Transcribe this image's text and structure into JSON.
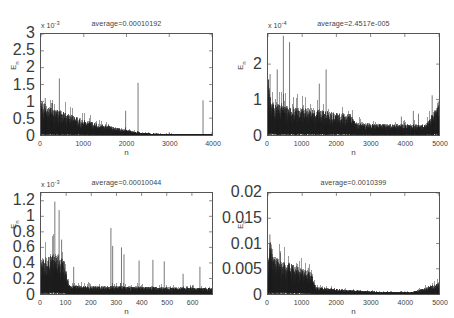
{
  "figure": {
    "background": "#ffffff",
    "axis_color": "#555555",
    "line_color": "#1a1a1a",
    "text_color": "#3f3f3f",
    "rows": 2,
    "cols": 2
  },
  "chart_data": [
    {
      "type": "line",
      "id": "subplot-top-left",
      "title": "average=0.00010192",
      "average": 0.00010192,
      "xlabel": "n",
      "ylabel": "E_n",
      "y_exponent_label": "x 10",
      "y_exponent": "-3",
      "y_scale": 0.001,
      "xlim": [
        0,
        4000
      ],
      "ylim": [
        0,
        3
      ],
      "xticks": [
        0,
        1000,
        2000,
        3000,
        4000
      ],
      "yticks": [
        0,
        0.5,
        1,
        1.5,
        2,
        2.5,
        3
      ],
      "xtick_labels": [
        "0",
        "1000",
        "2000",
        "3000",
        "4000"
      ],
      "ytick_labels": [
        "0",
        "0.5",
        "1",
        "1.5",
        "2",
        "2.5",
        "3"
      ],
      "grid": false,
      "legend": null,
      "noise_envelope": [
        {
          "x": 0,
          "y": 1.15
        },
        {
          "x": 60,
          "y": 1.0
        },
        {
          "x": 150,
          "y": 0.85
        },
        {
          "x": 300,
          "y": 0.78
        },
        {
          "x": 500,
          "y": 0.72
        },
        {
          "x": 800,
          "y": 0.55
        },
        {
          "x": 1100,
          "y": 0.42
        },
        {
          "x": 1500,
          "y": 0.3
        },
        {
          "x": 1900,
          "y": 0.2
        },
        {
          "x": 2200,
          "y": 0.1
        },
        {
          "x": 2600,
          "y": 0.05
        },
        {
          "x": 3200,
          "y": 0.03
        },
        {
          "x": 4000,
          "y": 0.03
        }
      ],
      "spikes": [
        {
          "x": 430,
          "y": 1.68
        },
        {
          "x": 1980,
          "y": 0.72
        },
        {
          "x": 2270,
          "y": 1.55
        },
        {
          "x": 3790,
          "y": 1.03
        },
        {
          "x": 100,
          "y": 1.1
        },
        {
          "x": 250,
          "y": 0.95
        }
      ]
    },
    {
      "type": "line",
      "id": "subplot-top-right",
      "title": "average=2.4517e-005",
      "average": 2.4517e-05,
      "xlabel": "n",
      "ylabel": "E_n",
      "y_exponent_label": "x 10",
      "y_exponent": "-4",
      "y_scale": 0.0001,
      "xlim": [
        0,
        5000
      ],
      "ylim": [
        0,
        2.85
      ],
      "xticks": [
        0,
        1000,
        2000,
        3000,
        4000,
        5000
      ],
      "yticks": [
        0,
        1,
        2
      ],
      "xtick_labels": [
        "0",
        "1000",
        "2000",
        "3000",
        "4000",
        "5000"
      ],
      "ytick_labels": [
        "0",
        "1",
        "2"
      ],
      "grid": false,
      "legend": null,
      "noise_envelope": [
        {
          "x": 0,
          "y": 1.7
        },
        {
          "x": 100,
          "y": 0.95
        },
        {
          "x": 400,
          "y": 0.85
        },
        {
          "x": 900,
          "y": 0.8
        },
        {
          "x": 1400,
          "y": 0.75
        },
        {
          "x": 1900,
          "y": 0.65
        },
        {
          "x": 2400,
          "y": 0.6
        },
        {
          "x": 2600,
          "y": 0.35
        },
        {
          "x": 3200,
          "y": 0.32
        },
        {
          "x": 4000,
          "y": 0.3
        },
        {
          "x": 4600,
          "y": 0.3
        },
        {
          "x": 5000,
          "y": 0.9
        }
      ],
      "spikes": [
        {
          "x": 60,
          "y": 1.72
        },
        {
          "x": 270,
          "y": 1.85
        },
        {
          "x": 450,
          "y": 2.8
        },
        {
          "x": 630,
          "y": 2.62
        },
        {
          "x": 1500,
          "y": 1.45
        },
        {
          "x": 1700,
          "y": 1.85
        },
        {
          "x": 3900,
          "y": 0.52
        },
        {
          "x": 4250,
          "y": 0.68
        },
        {
          "x": 4400,
          "y": 0.6
        },
        {
          "x": 4800,
          "y": 1.12
        },
        {
          "x": 4980,
          "y": 0.95
        }
      ]
    },
    {
      "type": "line",
      "id": "subplot-bottom-left",
      "title": "average=0.00010044",
      "average": 0.00010044,
      "xlabel": "n",
      "ylabel": "E_n",
      "y_exponent_label": "x 10",
      "y_exponent": "-3",
      "y_scale": 0.001,
      "xlim": [
        0,
        680
      ],
      "ylim": [
        0,
        1.3
      ],
      "xticks": [
        0,
        100,
        200,
        300,
        400,
        500,
        600
      ],
      "yticks": [
        0,
        0.2,
        0.4,
        0.6,
        0.8,
        1,
        1.2
      ],
      "xtick_labels": [
        "0",
        "100",
        "200",
        "300",
        "400",
        "500",
        "600"
      ],
      "ytick_labels": [
        "0",
        "0.2",
        "0.4",
        "0.6",
        "0.8",
        "1",
        "1.2"
      ],
      "grid": false,
      "legend": null,
      "noise_envelope": [
        {
          "x": 0,
          "y": 0.45
        },
        {
          "x": 30,
          "y": 0.5
        },
        {
          "x": 60,
          "y": 0.55
        },
        {
          "x": 95,
          "y": 0.42
        },
        {
          "x": 110,
          "y": 0.12
        },
        {
          "x": 200,
          "y": 0.1
        },
        {
          "x": 350,
          "y": 0.1
        },
        {
          "x": 500,
          "y": 0.09
        },
        {
          "x": 680,
          "y": 0.08
        }
      ],
      "spikes": [
        {
          "x": 55,
          "y": 1.19
        },
        {
          "x": 72,
          "y": 1.08
        },
        {
          "x": 82,
          "y": 0.7
        },
        {
          "x": 130,
          "y": 0.35
        },
        {
          "x": 278,
          "y": 0.85
        },
        {
          "x": 285,
          "y": 0.62
        },
        {
          "x": 320,
          "y": 0.6
        },
        {
          "x": 330,
          "y": 0.51
        },
        {
          "x": 390,
          "y": 0.43
        },
        {
          "x": 445,
          "y": 0.44
        },
        {
          "x": 490,
          "y": 0.42
        },
        {
          "x": 565,
          "y": 0.26
        },
        {
          "x": 632,
          "y": 0.35
        }
      ]
    },
    {
      "type": "line",
      "id": "subplot-bottom-right",
      "title": "average=0.0010399",
      "average": 0.0010399,
      "xlabel": "n",
      "ylabel": "E_n",
      "y_exponent_label": "",
      "y_exponent": "",
      "y_scale": 1,
      "xlim": [
        0,
        5000
      ],
      "ylim": [
        0,
        0.02
      ],
      "xticks": [
        0,
        1000,
        2000,
        3000,
        4000,
        5000
      ],
      "yticks": [
        0,
        0.005,
        0.01,
        0.015,
        0.02
      ],
      "xtick_labels": [
        "0",
        "1000",
        "2000",
        "3000",
        "4000",
        "5000"
      ],
      "ytick_labels": [
        "0",
        "0.005",
        "0.01",
        "0.015",
        "0.02"
      ],
      "grid": false,
      "legend": null,
      "noise_envelope": [
        {
          "x": 0,
          "y": 0.0055
        },
        {
          "x": 60,
          "y": 0.0115
        },
        {
          "x": 150,
          "y": 0.0075
        },
        {
          "x": 400,
          "y": 0.0068
        },
        {
          "x": 700,
          "y": 0.006
        },
        {
          "x": 1000,
          "y": 0.0052
        },
        {
          "x": 1250,
          "y": 0.0045
        },
        {
          "x": 1400,
          "y": 0.0015
        },
        {
          "x": 1800,
          "y": 0.0012
        },
        {
          "x": 2400,
          "y": 0.0008
        },
        {
          "x": 3200,
          "y": 0.0005
        },
        {
          "x": 4200,
          "y": 0.0004
        },
        {
          "x": 5000,
          "y": 0.0022
        }
      ],
      "spikes": [
        {
          "x": 55,
          "y": 0.0118
        },
        {
          "x": 95,
          "y": 0.0098
        },
        {
          "x": 620,
          "y": 0.0062
        },
        {
          "x": 1180,
          "y": 0.0052
        },
        {
          "x": 4990,
          "y": 0.0023
        }
      ]
    }
  ]
}
